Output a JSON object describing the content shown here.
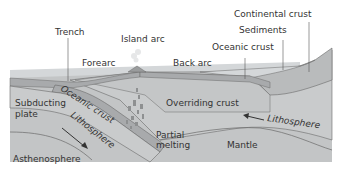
{
  "diagram": {
    "labels": {
      "trench": "Trench",
      "island_arc": "Island arc",
      "forearc": "Forearc",
      "back_arc": "Back arc",
      "continental_crust": "Continental crust",
      "sediments": "Sediments",
      "oceanic_crust_top": "Oceanic crust",
      "subducting_plate_line1": "Subducting",
      "subducting_plate_line2": "plate",
      "oceanic_crust_slab": "Oceanic crust",
      "lithosphere_slab": "Lithosphere",
      "overriding_crust": "Overriding crust",
      "partial_melting_line1": "Partial",
      "partial_melting_line2": "melting",
      "lithosphere_right": "Lithosphere",
      "mantle": "Mantle",
      "asthenosphere": "Asthenosphere"
    },
    "colors": {
      "water": "#d4d7d9",
      "crust": "#a8aaac",
      "lithosphere": "#c9cbcc",
      "mantle": "#c3c5c6",
      "continent": "#b9bbbc",
      "lines": "#555555",
      "text": "#333333"
    }
  }
}
